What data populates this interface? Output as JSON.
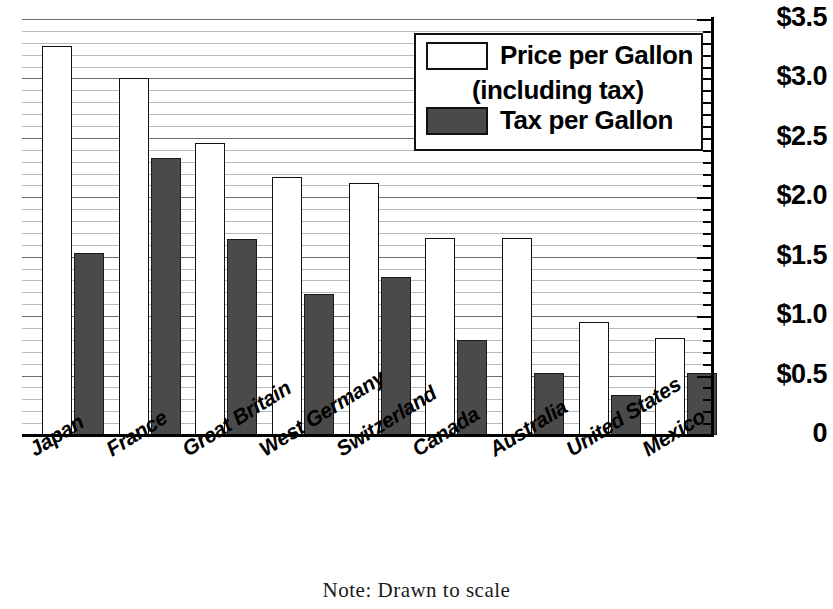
{
  "chart_data": {
    "type": "bar",
    "title": "",
    "xlabel": "",
    "ylabel": "",
    "ylim": [
      0,
      3.5
    ],
    "grid": true,
    "legend_position": "top-right",
    "categories": [
      "Japan",
      "France",
      "Great Britain",
      "West Germany",
      "Switzerland",
      "Canada",
      "Australia",
      "United States",
      "Mexico"
    ],
    "series": [
      {
        "name": "Price per Gallon (including tax)",
        "values": [
          3.27,
          3.0,
          2.46,
          2.17,
          2.12,
          1.66,
          1.66,
          0.95,
          0.82
        ],
        "fill": "#ffffff"
      },
      {
        "name": "Tax per Gallon",
        "values": [
          1.53,
          2.33,
          1.65,
          1.19,
          1.33,
          0.8,
          0.52,
          0.34,
          0.52
        ],
        "fill": "#4a4a4a"
      }
    ],
    "ytick_labels": [
      "$3.5",
      "$3.0",
      "$2.5",
      "$2.0",
      "$1.5",
      "$1.0",
      "$0.5",
      "0"
    ],
    "ytick_values": [
      3.5,
      3.0,
      2.5,
      2.0,
      1.5,
      1.0,
      0.5,
      0
    ],
    "minor_tick_step": 0.1,
    "annotations": [
      "Note: Drawn to scale"
    ]
  },
  "legend": {
    "series1_line1": "Price per Gallon",
    "series1_line2": "(including tax)",
    "series2_line1": "Tax per Gallon"
  },
  "note": {
    "text": "Note: Drawn to scale"
  }
}
